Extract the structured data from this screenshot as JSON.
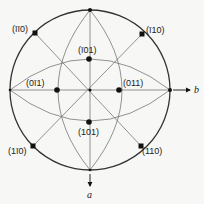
{
  "diagram": {
    "type": "stereographic-projection",
    "colors": {
      "line": "#555555",
      "circle": "#333333",
      "dot": "#111111",
      "background": "#f7f7f5"
    },
    "primitive_circle": {
      "cx": 90,
      "cy": 90,
      "r": 80
    },
    "poles": [
      {
        "id": "m1m10",
        "label": "(īī0)",
        "x": 35,
        "y": 33,
        "lx": 14,
        "ly": 31,
        "anchor": "start"
      },
      {
        "id": "m110",
        "label": "(ī10)",
        "x": 142,
        "y": 34,
        "lx": 146,
        "ly": 32,
        "anchor": "start"
      },
      {
        "id": "m101",
        "label": "(ī01)",
        "x": 89,
        "y": 59,
        "lx": 80,
        "ly": 52,
        "anchor": "start"
      },
      {
        "id": "0m11",
        "label": "(0ī1)",
        "x": 57,
        "y": 90,
        "lx": 26,
        "ly": 85,
        "anchor": "start"
      },
      {
        "id": "011",
        "label": "(011)",
        "x": 119,
        "y": 90,
        "lx": 124,
        "ly": 85,
        "anchor": "start"
      },
      {
        "id": "101",
        "label": "(101)",
        "x": 89,
        "y": 122,
        "lx": 79,
        "ly": 135,
        "anchor": "start"
      },
      {
        "id": "1m10",
        "label": "(1ī0)",
        "x": 33,
        "y": 146,
        "lx": 9,
        "ly": 153,
        "anchor": "start"
      },
      {
        "id": "110",
        "label": "(110)",
        "x": 141,
        "y": 146,
        "lx": 143,
        "ly": 154,
        "anchor": "start"
      }
    ],
    "edge_points": [
      {
        "id": "top",
        "x": 90,
        "y": 10
      },
      {
        "id": "left",
        "x": 10,
        "y": 90
      },
      {
        "id": "right",
        "x": 170,
        "y": 90
      },
      {
        "id": "bottom",
        "x": 90,
        "y": 170
      },
      {
        "id": "center",
        "x": 90,
        "y": 90
      }
    ],
    "axes": {
      "b": {
        "label": "b",
        "x1": 172,
        "y1": 90,
        "x2": 192,
        "y2": 90,
        "lx": 195,
        "ly": 93
      },
      "a": {
        "label": "a",
        "x1": 90,
        "y1": 173,
        "x2": 90,
        "y2": 186,
        "lx": 87,
        "ly": 197
      }
    }
  }
}
